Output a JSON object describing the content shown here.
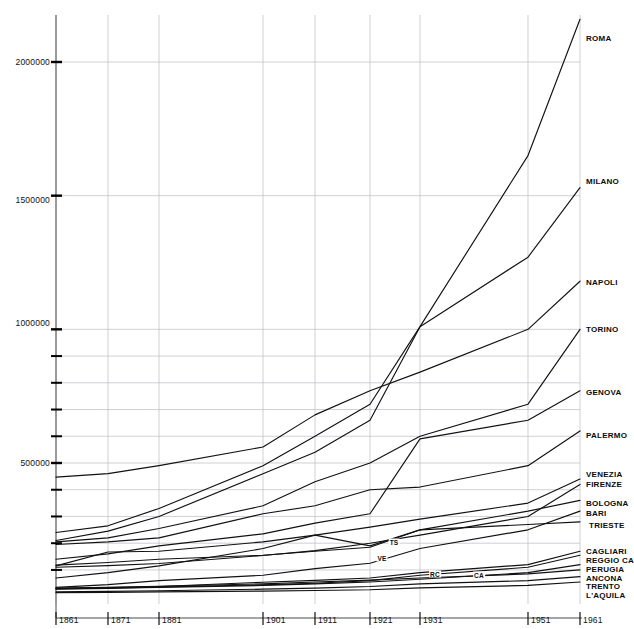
{
  "chart_data": {
    "type": "line",
    "title": "",
    "xlabel": "",
    "ylabel": "",
    "x": [
      1861,
      1871,
      1881,
      1901,
      1911,
      1921,
      1931,
      1951,
      1961
    ],
    "xticklabels": [
      "1861",
      "1871",
      "1881",
      "1901",
      "1911",
      "1921",
      "1931",
      "1951",
      "1961"
    ],
    "yticklabels": [
      "500000",
      "1000000",
      "1500000",
      "2000000"
    ],
    "ytickvalues": [
      500000,
      1000000,
      1500000,
      2000000
    ],
    "yminortickvalues": [
      100000,
      200000,
      300000,
      400000,
      600000,
      700000,
      800000,
      900000
    ],
    "ylim": [
      0,
      2200000
    ],
    "xlim": [
      1861,
      1961
    ],
    "grid": true,
    "legend_position": "right-outside-line-ends",
    "series": [
      {
        "name": "ROMA",
        "label": "ROMA",
        "values": [
          210000,
          245000,
          300000,
          460000,
          540000,
          660000,
          1010000,
          1650000,
          2160000
        ]
      },
      {
        "name": "MILANO",
        "label": "MILANO",
        "values": [
          240000,
          265000,
          330000,
          490000,
          600000,
          720000,
          1010000,
          1270000,
          1530000
        ]
      },
      {
        "name": "NAPOLI",
        "label": "NAPOLI",
        "values": [
          447000,
          460000,
          490000,
          560000,
          680000,
          770000,
          840000,
          1000000,
          1180000
        ]
      },
      {
        "name": "TORINO",
        "label": "TORINO",
        "values": [
          205000,
          220000,
          255000,
          340000,
          430000,
          500000,
          600000,
          720000,
          1000000
        ]
      },
      {
        "name": "GENOVA",
        "label": "GENOVA",
        "values": [
          140000,
          160000,
          190000,
          235000,
          275000,
          310000,
          590000,
          660000,
          770000
        ]
      },
      {
        "name": "PALERMO",
        "label": "PALERMO",
        "values": [
          195000,
          205000,
          220000,
          310000,
          340000,
          400000,
          410000,
          490000,
          620000
        ]
      },
      {
        "name": "VENEZIA",
        "label": "VENEZIA",
        "values": [
          118000,
          128000,
          140000,
          155000,
          170000,
          185000,
          250000,
          320000,
          360000
        ]
      },
      {
        "name": "FIRENZE",
        "label": "FIRENZE",
        "values": [
          115000,
          167000,
          170000,
          205000,
          230000,
          260000,
          290000,
          350000,
          440000
        ]
      },
      {
        "name": "BOLOGNA",
        "label": "BOLOGNA",
        "values": [
          110000,
          116000,
          124000,
          154000,
          172000,
          200000,
          230000,
          300000,
          420000
        ]
      },
      {
        "name": "BARI",
        "label": "BARI",
        "values": [
          35000,
          45000,
          60000,
          80000,
          105000,
          125000,
          180000,
          250000,
          320000
        ]
      },
      {
        "name": "TRIESTE",
        "label": "TRIESTE",
        "values": [
          70000,
          90000,
          115000,
          180000,
          230000,
          190000,
          250000,
          270000,
          280000
        ]
      },
      {
        "name": "CAGLIARI",
        "label": "CAGLIARI",
        "values": [
          30000,
          34000,
          38000,
          54000,
          61000,
          70000,
          90000,
          120000,
          170000
        ]
      },
      {
        "name": "REGGIO CAL",
        "label": "REGGIO CA",
        "values": [
          28000,
          31000,
          36000,
          44000,
          50000,
          60000,
          80000,
          110000,
          155000
        ]
      },
      {
        "name": "PERUGIA",
        "label": "PERUGIA",
        "values": [
          30000,
          32000,
          35000,
          42000,
          48000,
          55000,
          65000,
          90000,
          120000
        ]
      },
      {
        "name": "ANCONA",
        "label": "ANCONA",
        "values": [
          32000,
          35000,
          39000,
          48000,
          55000,
          62000,
          70000,
          85000,
          100000
        ]
      },
      {
        "name": "TRENTO",
        "label": "TRENTO",
        "values": [
          18000,
          20000,
          22000,
          28000,
          32000,
          38000,
          48000,
          60000,
          75000
        ]
      },
      {
        "name": "L'AQUILA",
        "label": "L'AQUILA",
        "values": [
          15000,
          16000,
          18000,
          21000,
          23000,
          26000,
          33000,
          42000,
          55000
        ]
      }
    ],
    "inner_annotations": [
      {
        "text": "TS",
        "series": "TRIESTE",
        "x": 1921
      },
      {
        "text": "VE",
        "series": "VENEZIA",
        "x": 1921
      },
      {
        "text": "RC",
        "series": "REGGIO CAL",
        "x": 1931
      },
      {
        "text": "CA",
        "series": "CAGLIARI",
        "x": 1940
      }
    ]
  },
  "axis": {
    "y_ticks": [
      {
        "label": "2000000",
        "y": 62
      },
      {
        "label": "1500000",
        "y": 200
      },
      {
        "label": "1000000",
        "y": 323
      },
      {
        "label": "500000",
        "y": 463
      }
    ],
    "x_ticks": [
      {
        "label": "1861",
        "x": 56
      },
      {
        "label": "1871",
        "x": 108
      },
      {
        "label": "1881",
        "x": 159
      },
      {
        "label": "1901",
        "x": 263
      },
      {
        "label": "1911",
        "x": 315
      },
      {
        "label": "1921",
        "x": 370
      },
      {
        "label": "1931",
        "x": 420
      },
      {
        "label": "1951",
        "x": 528
      },
      {
        "label": "1961",
        "x": 580
      }
    ]
  },
  "series_labels": [
    {
      "text": "ROMA",
      "x": 586,
      "y": 38
    },
    {
      "text": "MILANO",
      "x": 586,
      "y": 181
    },
    {
      "text": "NAPOLI",
      "x": 586,
      "y": 282
    },
    {
      "text": "TORINO",
      "x": 586,
      "y": 329
    },
    {
      "text": "GENOVA",
      "x": 586,
      "y": 392
    },
    {
      "text": "PALERMO",
      "x": 586,
      "y": 435
    },
    {
      "text": "VENEZIA",
      "x": 586,
      "y": 474
    },
    {
      "text": "FIRENZE",
      "x": 586,
      "y": 484
    },
    {
      "text": "BOLOGNA",
      "x": 586,
      "y": 503
    },
    {
      "text": "BARI",
      "x": 586,
      "y": 513
    },
    {
      "text": "TRIESTE",
      "x": 589,
      "y": 525
    },
    {
      "text": "CAGLIARI",
      "x": 586,
      "y": 551
    },
    {
      "text": "REGGIO CA",
      "x": 586,
      "y": 560
    },
    {
      "text": "PERUGIA",
      "x": 586,
      "y": 569
    },
    {
      "text": "ANCONA",
      "x": 586,
      "y": 578
    },
    {
      "text": "TRENTO",
      "x": 586,
      "y": 586
    },
    {
      "text": "L'AQUILA",
      "x": 586,
      "y": 595
    }
  ],
  "inner_labels": [
    {
      "text": "TS",
      "x": 394,
      "y": 542
    },
    {
      "text": "VE",
      "x": 382,
      "y": 558
    },
    {
      "text": "RC",
      "x": 435,
      "y": 574
    },
    {
      "text": "CA",
      "x": 479,
      "y": 575
    }
  ],
  "colors": {
    "line": "#111111",
    "grid": "#bbbbc4",
    "axis": "#4a4a52",
    "text": "#111111",
    "background": "#ffffff"
  }
}
